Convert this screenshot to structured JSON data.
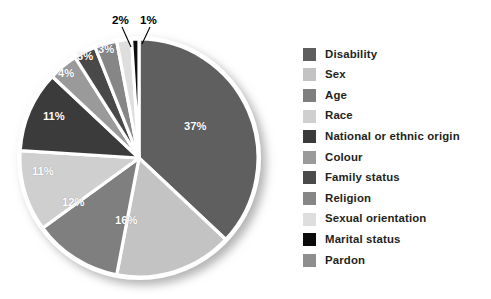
{
  "chart_data": {
    "type": "pie",
    "title": "",
    "subtitle": "",
    "xlabel": "",
    "ylabel": "",
    "legend_position": "right",
    "grid": false,
    "start_angle_deg": 0,
    "direction": "clockwise",
    "categories": [
      "Disability",
      "Sex",
      "Age",
      "Race",
      "National or ethnic origin",
      "Colour",
      "Family status",
      "Religion",
      "Sexual orientation",
      "Marital status",
      "Pardon"
    ],
    "values": [
      37,
      16,
      12,
      11,
      11,
      4,
      3,
      3,
      2,
      1,
      0
    ],
    "value_labels": [
      "37%",
      "16%",
      "12%",
      "11%",
      "11%",
      "4%",
      "3%",
      "3%",
      "2%",
      "1%",
      ""
    ],
    "colors": [
      "#5e5e5e",
      "#c3c3c3",
      "#7f7f7f",
      "#cfcfcf",
      "#3a3a3a",
      "#9a9a9a",
      "#4a4a4a",
      "#868686",
      "#dedede",
      "#0b0b0b",
      "#8e8e8e"
    ]
  },
  "pie": {
    "slice_labels": [
      {
        "text": "37%",
        "left": 184,
        "top": 120
      },
      {
        "text": "16%",
        "left": 115,
        "top": 214
      },
      {
        "text": "12%",
        "left": 62,
        "top": 196
      },
      {
        "text": "11%",
        "left": 32,
        "top": 165
      },
      {
        "text": "11%",
        "left": 43,
        "top": 110
      },
      {
        "text": "4%",
        "left": 58,
        "top": 67
      },
      {
        "text": "3%",
        "left": 77,
        "top": 50
      },
      {
        "text": "3%",
        "left": 98,
        "top": 43
      }
    ],
    "callouts": [
      {
        "text": "2%",
        "left": 112,
        "top": 13
      },
      {
        "text": "1%",
        "left": 140,
        "top": 13
      }
    ]
  },
  "legend": {
    "items": [
      {
        "label": "Disability",
        "color": "#5e5e5e"
      },
      {
        "label": "Sex",
        "color": "#c3c3c3"
      },
      {
        "label": "Age",
        "color": "#7f7f7f"
      },
      {
        "label": "Race",
        "color": "#cfcfcf"
      },
      {
        "label": "National or ethnic origin",
        "color": "#3a3a3a"
      },
      {
        "label": "Colour",
        "color": "#9a9a9a"
      },
      {
        "label": "Family status",
        "color": "#4a4a4a"
      },
      {
        "label": "Religion",
        "color": "#868686"
      },
      {
        "label": "Sexual orientation",
        "color": "#dedede"
      },
      {
        "label": "Marital status",
        "color": "#0b0b0b"
      },
      {
        "label": "Pardon",
        "color": "#8e8e8e"
      }
    ]
  },
  "style": {
    "background": "#ffffff",
    "slice_gap_color": "#ffffff",
    "label_text_color": "#ffffff",
    "legend_text_color": "#231f20"
  }
}
